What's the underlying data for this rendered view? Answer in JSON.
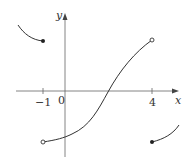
{
  "graph": {
    "x_axis_label": "x",
    "y_axis_label": "y",
    "origin_label": "0",
    "ticks": [
      {
        "value": -1,
        "label": "−1"
      },
      {
        "value": 4,
        "label": "4"
      }
    ],
    "pieces": [
      {
        "name": "left-branch",
        "domain": "x < -1",
        "endpoint": {
          "x": -1,
          "type": "closed",
          "position": "above"
        }
      },
      {
        "name": "middle-branch",
        "domain": "-1 < x < 4",
        "left_endpoint": {
          "x": -1,
          "type": "open",
          "position": "below"
        },
        "right_endpoint": {
          "x": 4,
          "type": "open",
          "position": "above"
        }
      },
      {
        "name": "right-branch",
        "domain": "x >= 4",
        "endpoint": {
          "x": 4,
          "type": "closed",
          "position": "below"
        }
      }
    ],
    "colors": {
      "curve": "#333333",
      "axis": "#555555"
    }
  }
}
